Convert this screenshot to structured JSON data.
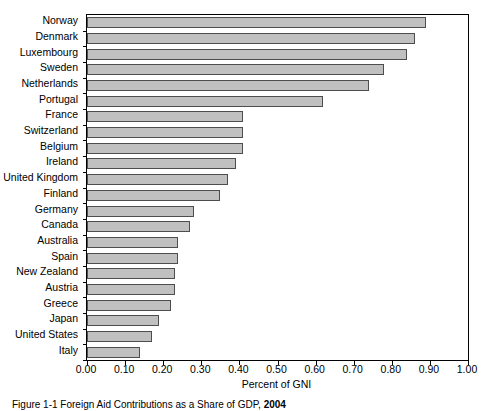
{
  "figure": {
    "caption_prefix": "Figure 1-1    Foreign Aid Contributions as a Share of GDP, 2004",
    "caption_bold": "2004"
  },
  "axis": {
    "x_title": "Percent of GNI",
    "x_ticks": [
      "0.00",
      "0.10",
      "0.20",
      "0.30",
      "0.40",
      "0.50",
      "0.60",
      "0.70",
      "0.80",
      "0.90",
      "1.00"
    ]
  },
  "chart_data": {
    "type": "bar",
    "orientation": "horizontal",
    "title": "",
    "subtitle": "",
    "xlabel": "Percent of GNI",
    "ylabel": "",
    "xlim": [
      0.0,
      1.0
    ],
    "grid": false,
    "legend": false,
    "bar_fill_color": "#c0c0c0",
    "bar_edge_color": "#4d4d4d",
    "categories": [
      "Norway",
      "Denmark",
      "Luxembourg",
      "Sweden",
      "Netherlands",
      "Portugal",
      "France",
      "Switzerland",
      "Belgium",
      "Ireland",
      "United Kingdom",
      "Finland",
      "Germany",
      "Canada",
      "Australia",
      "Spain",
      "New Zealand",
      "Austria",
      "Greece",
      "Japan",
      "United States",
      "Italy"
    ],
    "values": [
      0.89,
      0.86,
      0.84,
      0.78,
      0.74,
      0.62,
      0.41,
      0.41,
      0.41,
      0.39,
      0.37,
      0.35,
      0.28,
      0.27,
      0.24,
      0.24,
      0.23,
      0.23,
      0.22,
      0.19,
      0.17,
      0.14
    ]
  }
}
